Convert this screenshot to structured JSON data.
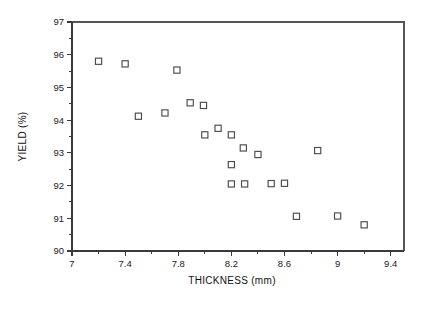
{
  "chart_data": {
    "type": "scatter",
    "title": "",
    "xlabel": "THICKNESS (mm)",
    "ylabel": "YIELD (%)",
    "xlim": [
      7,
      9.5
    ],
    "ylim": [
      90,
      97
    ],
    "grid": false,
    "legend": null,
    "x_ticks_major": [
      7,
      7.4,
      7.8,
      8.2,
      8.6,
      9,
      9.4
    ],
    "x_ticklabels": [
      "7",
      "7.4",
      "7.8",
      "8.2",
      "8.6",
      "9",
      "9.4"
    ],
    "x_ticks_minor": [
      7.2,
      7.6,
      8.0,
      8.4,
      8.8,
      9.2
    ],
    "y_ticks_major": [
      90,
      91,
      92,
      93,
      94,
      95,
      96,
      97
    ],
    "y_ticklabels": [
      "90",
      "91",
      "92",
      "93",
      "94",
      "95",
      "96",
      "97"
    ],
    "marker": "open-square",
    "marker_color": "#4a4a52",
    "points": [
      {
        "x": 7.2,
        "y": 95.8
      },
      {
        "x": 7.4,
        "y": 95.72
      },
      {
        "x": 7.5,
        "y": 94.12
      },
      {
        "x": 7.7,
        "y": 94.22
      },
      {
        "x": 7.79,
        "y": 95.53
      },
      {
        "x": 7.89,
        "y": 94.53
      },
      {
        "x": 7.99,
        "y": 94.45
      },
      {
        "x": 8.0,
        "y": 93.55
      },
      {
        "x": 8.1,
        "y": 93.75
      },
      {
        "x": 8.2,
        "y": 93.55
      },
      {
        "x": 8.2,
        "y": 92.64
      },
      {
        "x": 8.2,
        "y": 92.05
      },
      {
        "x": 8.29,
        "y": 93.15
      },
      {
        "x": 8.3,
        "y": 92.05
      },
      {
        "x": 8.4,
        "y": 92.95
      },
      {
        "x": 8.5,
        "y": 92.06
      },
      {
        "x": 8.6,
        "y": 92.07
      },
      {
        "x": 8.69,
        "y": 91.06
      },
      {
        "x": 8.85,
        "y": 93.07
      },
      {
        "x": 9.0,
        "y": 91.07
      },
      {
        "x": 9.2,
        "y": 90.8
      }
    ]
  }
}
